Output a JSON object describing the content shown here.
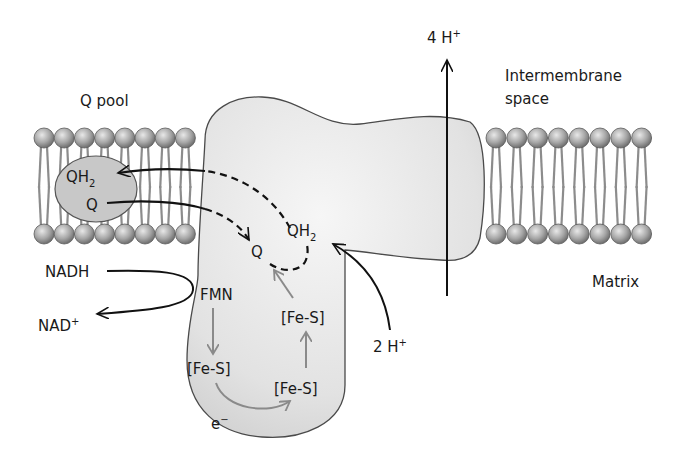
{
  "labels": {
    "q_pool": "Q pool",
    "intermembrane_space_line1": "Intermembrane",
    "intermembrane_space_line2": "space",
    "matrix": "Matrix",
    "four_h": "4 H",
    "four_h_sup": "+",
    "two_h": "2 H",
    "two_h_sup": "+",
    "nadh": "NADH",
    "nad": "NAD",
    "nad_sup": "+",
    "fmn": "FMN",
    "fes_1": "[Fe-S]",
    "fes_2": "[Fe-S]",
    "fes_3": "[Fe-S]",
    "electron": "e",
    "electron_sup": "−",
    "pool_qh2": "QH",
    "pool_qh2_sub": "2",
    "pool_q": "Q",
    "site_q": "Q",
    "site_qh2": "QH",
    "site_qh2_sub": "2"
  },
  "colors": {
    "protein_fill": "#e6e6e6",
    "protein_stroke": "#4a4a4a",
    "lipid_head": "#9a9a9a",
    "lipid_tail": "#8c8c8c",
    "q_pool_fill": "#c8c8c8",
    "arrow_black": "#111111",
    "arrow_gray": "#8a8a8a"
  }
}
